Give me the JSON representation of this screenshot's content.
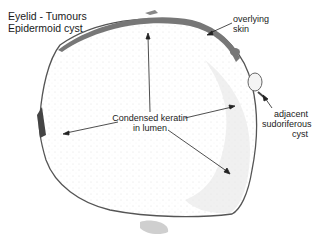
{
  "title": {
    "line1": "Eyelid - Tumours",
    "line2": "Epidermoid cyst"
  },
  "labels": {
    "overlying_skin": {
      "line1": "overlying",
      "line2": "skin"
    },
    "keratin": {
      "line1": "Condensed keratin",
      "line2": "in lumen"
    },
    "sudoriferous": {
      "line1": "adjacent",
      "line2": "sudoriferous",
      "line3": "cyst"
    }
  },
  "colors": {
    "background": "#ffffff",
    "cyst_wall": "#555555",
    "skin": "#6a6a6a",
    "text": "#222222"
  }
}
